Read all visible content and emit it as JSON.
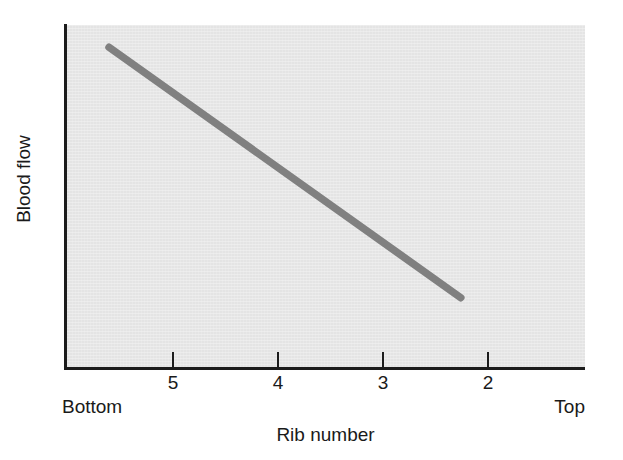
{
  "figure": {
    "background_color": "#ffffff",
    "plot_background_color": "#e4e4e4",
    "axis_color": "#1c1c1c",
    "line_color": "#808080"
  },
  "chart_data": {
    "type": "line",
    "title": "",
    "subtitle": "",
    "xlabel": "Rib number",
    "ylabel": "Blood flow",
    "x_tick_labels": [
      "5",
      "4",
      "3",
      "2"
    ],
    "x_tick_values": [
      5,
      4,
      3,
      2
    ],
    "x_axis_endpoint_left": "Bottom",
    "x_axis_endpoint_right": "Top",
    "y_tick_labels": [],
    "grid": false,
    "legend": null,
    "annotations": [],
    "xlim_note": "axis runs from lung Bottom (left) to Top (right); rib numbers decrease left to right",
    "ylim_note": "Blood flow, unlabeled relative scale",
    "series": [
      {
        "name": "Blood flow vs rib number",
        "style": "thick straight line",
        "color": "#808080",
        "x": [
          5.6,
          2.25
        ],
        "y": [
          0.935,
          0.205
        ],
        "points": [
          {
            "x_rib": 5.6,
            "y_relative": 0.935
          },
          {
            "x_rib": 2.25,
            "y_relative": 0.205
          }
        ],
        "description": "Blood flow decreases linearly from the bottom of the lung (high rib number) to the top of the lung (low rib number)."
      }
    ]
  }
}
